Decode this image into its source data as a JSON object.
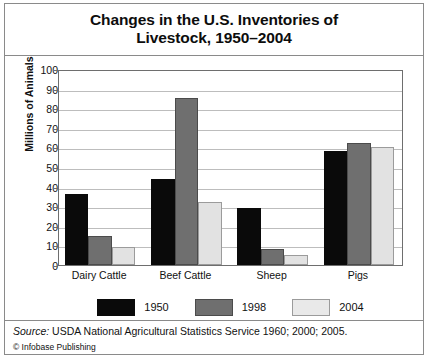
{
  "chart_data": {
    "type": "bar",
    "title": "Changes in the U.S. Inventories of Livestock, 1950–2004",
    "title_line1": "Changes in the U.S. Inventories of",
    "title_line2": "Livestock, 1950–2004",
    "xlabel": "",
    "ylabel": "Millions of Animals",
    "ylim": [
      0,
      100
    ],
    "ytick_step": 10,
    "yticks": [
      "0",
      "10",
      "20",
      "30",
      "40",
      "50",
      "60",
      "70",
      "80",
      "90",
      "100"
    ],
    "grid": true,
    "legend_position": "bottom",
    "categories": [
      "Dairy Cattle",
      "Beef Cattle",
      "Sheep",
      "Pigs"
    ],
    "series": [
      {
        "name": "1950",
        "color": "#0a0a0a",
        "values": [
          36,
          44,
          29,
          58
        ]
      },
      {
        "name": "1998",
        "color": "#6f6f6f",
        "values": [
          15,
          85,
          8,
          62
        ]
      },
      {
        "name": "2004",
        "color": "#e2e2e2",
        "values": [
          9,
          32,
          5,
          60
        ]
      }
    ]
  },
  "footer": {
    "source_word": "Source:",
    "source_text": " USDA National Agricultural Statistics Service 1960; 2000; 2005.",
    "copyright": "© Infobase Publishing"
  }
}
